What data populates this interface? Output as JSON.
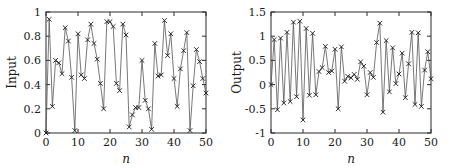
{
  "figure": {
    "background": "#ffffff",
    "axis_color": "#2b2b2b",
    "line_color": "#555555",
    "marker_color": "#1a1a1a",
    "marker_style": "x"
  },
  "chart_data": [
    {
      "type": "line",
      "panel": "left",
      "title": "",
      "xlabel": "n",
      "ylabel": "Input",
      "xlim": [
        0,
        50
      ],
      "ylim": [
        0,
        1
      ],
      "xticks": [
        0,
        10,
        20,
        30,
        40,
        50
      ],
      "xticklabels": [
        "0",
        "10",
        "20",
        "30",
        "40",
        "50"
      ],
      "yticks": [
        0,
        0.2,
        0.4,
        0.6,
        0.8,
        1
      ],
      "yticklabels": [
        "0",
        "0.2",
        "0.4",
        "0.6",
        "0.8",
        "1"
      ],
      "grid": false,
      "legend": null,
      "marker": "x",
      "x": [
        0,
        1,
        2,
        3,
        4,
        5,
        6,
        7,
        8,
        9,
        10,
        11,
        12,
        13,
        14,
        15,
        16,
        17,
        18,
        19,
        20,
        21,
        22,
        23,
        24,
        25,
        26,
        27,
        28,
        29,
        30,
        31,
        32,
        33,
        34,
        35,
        36,
        37,
        38,
        39,
        40,
        41,
        42,
        43,
        44,
        45,
        46,
        47,
        48,
        49,
        50
      ],
      "values": [
        0.0,
        0.94,
        0.22,
        0.6,
        0.58,
        0.49,
        0.87,
        0.76,
        0.46,
        0.02,
        0.82,
        0.48,
        0.45,
        0.77,
        0.9,
        0.74,
        0.61,
        0.41,
        0.2,
        0.92,
        0.92,
        0.88,
        0.41,
        0.35,
        0.9,
        0.81,
        0.05,
        0.15,
        0.21,
        0.21,
        0.6,
        0.27,
        0.2,
        0.03,
        0.74,
        0.47,
        0.48,
        0.93,
        0.64,
        0.82,
        0.45,
        0.22,
        0.53,
        0.68,
        0.83,
        0.02,
        0.39,
        0.69,
        0.59,
        0.45,
        0.33
      ]
    },
    {
      "type": "line",
      "panel": "right",
      "title": "",
      "xlabel": "n",
      "ylabel": "Output",
      "xlim": [
        0,
        50
      ],
      "ylim": [
        -1,
        1.5
      ],
      "xticks": [
        0,
        10,
        20,
        30,
        40,
        50
      ],
      "xticklabels": [
        "0",
        "10",
        "20",
        "30",
        "40",
        "50"
      ],
      "yticks": [
        -1,
        -0.5,
        0,
        0.5,
        1,
        1.5
      ],
      "yticklabels": [
        "-1",
        "-0.5",
        "0",
        "0.5",
        "1",
        "1.5"
      ],
      "grid": false,
      "legend": null,
      "marker": "x",
      "x": [
        0,
        1,
        2,
        3,
        4,
        5,
        6,
        7,
        8,
        9,
        10,
        11,
        12,
        13,
        14,
        15,
        16,
        17,
        18,
        19,
        20,
        21,
        22,
        23,
        24,
        25,
        26,
        27,
        28,
        29,
        30,
        31,
        32,
        33,
        34,
        35,
        36,
        37,
        38,
        39,
        40,
        41,
        42,
        43,
        44,
        45,
        46,
        47,
        48,
        49,
        50
      ],
      "values": [
        0.0,
        0.93,
        -0.52,
        0.96,
        -0.38,
        1.08,
        -0.35,
        1.29,
        -0.25,
        1.31,
        -0.73,
        1.16,
        -0.22,
        1.06,
        -0.21,
        0.27,
        0.35,
        0.79,
        0.25,
        0.28,
        0.73,
        -0.5,
        0.78,
        0.07,
        0.17,
        0.14,
        0.21,
        0.11,
        0.47,
        0.38,
        -0.21,
        0.25,
        0.15,
        0.87,
        1.27,
        -0.57,
        0.91,
        -0.15,
        0.76,
        0.02,
        0.22,
        0.65,
        -0.27,
        0.43,
        1.08,
        -0.41,
        1.07,
        -0.45,
        0.3,
        0.68,
        0.12
      ]
    }
  ]
}
